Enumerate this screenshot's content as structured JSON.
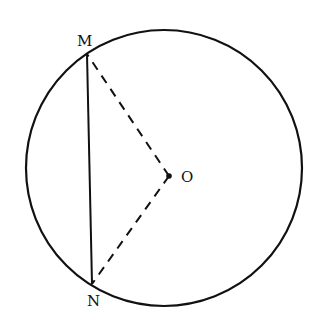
{
  "diagram": {
    "type": "geometry",
    "circle": {
      "cx": 164,
      "cy": 168,
      "r": 138,
      "stroke": "#111111"
    },
    "points": {
      "M": {
        "label": "M",
        "x": 87,
        "y": 54
      },
      "N": {
        "label": "N",
        "x": 92,
        "y": 284
      },
      "O": {
        "label": "O",
        "x": 169,
        "y": 176
      }
    },
    "segments": [
      {
        "from": "M",
        "to": "N",
        "style": "solid"
      },
      {
        "from": "O",
        "to": "M",
        "style": "dashed"
      },
      {
        "from": "O",
        "to": "N",
        "style": "dashed"
      }
    ],
    "labels": {
      "m": "M",
      "n": "N",
      "o": "O"
    }
  }
}
